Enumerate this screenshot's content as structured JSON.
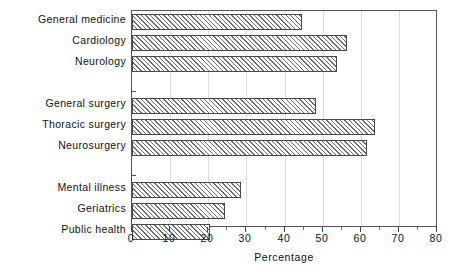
{
  "chart_data": {
    "type": "bar",
    "orientation": "horizontal",
    "title": "",
    "xlabel": "Percentage",
    "ylabel": "",
    "xlim": [
      0,
      80
    ],
    "ylim": null,
    "grid": true,
    "grid_axis": "x",
    "legend": null,
    "xticks": [
      0,
      10,
      20,
      30,
      40,
      50,
      60,
      70,
      80
    ],
    "xtick_labels": [
      "0",
      "10",
      "20",
      "30",
      "40",
      "50",
      "60",
      "70",
      "80"
    ],
    "categories": [
      "General medicine",
      "Cardiology",
      "Neurology",
      "General surgery",
      "Thoracic surgery",
      "Neurosurgery",
      "Mental illness",
      "Geriatrics",
      "Public health"
    ],
    "values": [
      44.5,
      56.3,
      53.6,
      48.1,
      63.5,
      61.4,
      28.5,
      24.3,
      20.4
    ],
    "groups": [
      {
        "name": "medical",
        "categories": [
          "General medicine",
          "Cardiology",
          "Neurology"
        ]
      },
      {
        "name": "surgical",
        "categories": [
          "General surgery",
          "Thoracic surgery",
          "Neurosurgery"
        ]
      },
      {
        "name": "other",
        "categories": [
          "Mental illness",
          "Geriatrics",
          "Public health"
        ]
      }
    ],
    "bar_style": {
      "fill": "diagonal-hatch",
      "edge_color": "#4a4a4a",
      "face_color": "#ffffff",
      "hatch_color": "#6f6f6f"
    }
  },
  "axis": {
    "x_title": "Percentage",
    "tick_labels": [
      "0",
      "10",
      "20",
      "30",
      "40",
      "50",
      "60",
      "70",
      "80"
    ]
  },
  "categories": [
    {
      "label": "General medicine",
      "value": 44.5
    },
    {
      "label": "Cardiology",
      "value": 56.3
    },
    {
      "label": "Neurology",
      "value": 53.6
    },
    {
      "label": "General surgery",
      "value": 48.1
    },
    {
      "label": "Thoracic surgery",
      "value": 63.5
    },
    {
      "label": "Neurosurgery",
      "value": 61.4
    },
    {
      "label": "Mental illness",
      "value": 28.5
    },
    {
      "label": "Geriatrics",
      "value": 24.3
    },
    {
      "label": "Public health",
      "value": 20.4
    }
  ]
}
